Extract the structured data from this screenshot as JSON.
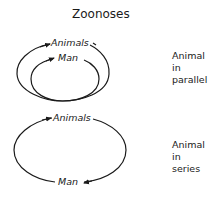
{
  "title": "Zoonoses",
  "diagram_parallel": {
    "outer_label": "Animals",
    "inner_label": "Man",
    "caption_lines": [
      "Animal",
      "in",
      "parallel"
    ]
  },
  "diagram_series": {
    "top_label": "Animals",
    "bottom_label": "Man",
    "caption_lines": [
      "Animal",
      "in",
      "series"
    ]
  },
  "colors": {
    "stroke": "#1a1a1a",
    "background": "#ffffff"
  }
}
